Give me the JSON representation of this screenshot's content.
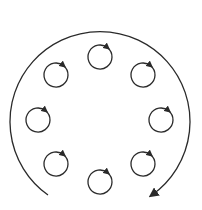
{
  "diagram": {
    "stroke_color": "#2a2a2a",
    "background": "#ffffff",
    "outer_arc": {
      "center": [
        100,
        118
      ],
      "radius": 90,
      "direction": "clockwise",
      "start_point": [
        48,
        195
      ],
      "end_point": [
        152,
        195
      ],
      "arrowhead": "end"
    },
    "small_circles": [
      {
        "id": "top",
        "cx": 100,
        "cy": 57,
        "r": 12,
        "rotation": "clockwise"
      },
      {
        "id": "top-right",
        "cx": 143,
        "cy": 75,
        "r": 12,
        "rotation": "clockwise"
      },
      {
        "id": "right",
        "cx": 161,
        "cy": 120,
        "r": 12,
        "rotation": "clockwise"
      },
      {
        "id": "bottom-right",
        "cx": 143,
        "cy": 164,
        "r": 12,
        "rotation": "clockwise"
      },
      {
        "id": "bottom",
        "cx": 100,
        "cy": 182,
        "r": 12,
        "rotation": "clockwise"
      },
      {
        "id": "bottom-left",
        "cx": 56,
        "cy": 164,
        "r": 12,
        "rotation": "clockwise"
      },
      {
        "id": "left",
        "cx": 38,
        "cy": 120,
        "r": 12,
        "rotation": "clockwise"
      },
      {
        "id": "top-left",
        "cx": 56,
        "cy": 75,
        "r": 12,
        "rotation": "clockwise"
      }
    ]
  }
}
